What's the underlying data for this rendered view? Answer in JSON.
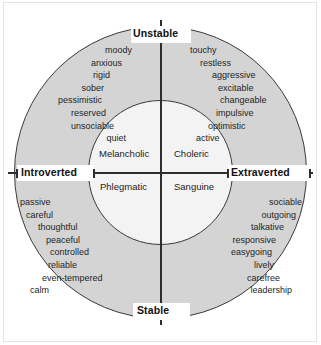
{
  "chart_data": {
    "type": "scatter",
    "xlabel": "Introverted — Extraverted",
    "ylabel": "Stable — Unstable",
    "axes": {
      "top": "Unstable",
      "bottom": "Stable",
      "left": "Introverted",
      "right": "Extraverted"
    },
    "quadrants": [
      {
        "name": "Melancholic",
        "position": "upper-left",
        "axis_x": "Introverted",
        "axis_y": "Unstable",
        "traits": [
          "moody",
          "anxious",
          "rigid",
          "sober",
          "pessimistic",
          "reserved",
          "unsociable",
          "quiet"
        ]
      },
      {
        "name": "Choleric",
        "position": "upper-right",
        "axis_x": "Extraverted",
        "axis_y": "Unstable",
        "traits": [
          "touchy",
          "restless",
          "aggressive",
          "excitable",
          "changeable",
          "impulsive",
          "optimistic",
          "active"
        ]
      },
      {
        "name": "Phlegmatic",
        "position": "lower-left",
        "axis_x": "Introverted",
        "axis_y": "Stable",
        "traits": [
          "passive",
          "careful",
          "thoughtful",
          "peaceful",
          "controlled",
          "reliable",
          "even-tempered",
          "calm"
        ]
      },
      {
        "name": "Sanguine",
        "position": "lower-right",
        "axis_x": "Extraverted",
        "axis_y": "Stable",
        "traits": [
          "sociable",
          "outgoing",
          "talkative",
          "responsive",
          "easygoing",
          "lively",
          "carefree",
          "leadership"
        ]
      }
    ],
    "colors": {
      "outer_ring_fill": "#d4d4d4",
      "inner_circle_fill": "#f3f3f3",
      "stroke": "#3a3a3a",
      "text": "#1f1f1f",
      "background": "#ffffff"
    },
    "grid": false,
    "legend": "none"
  }
}
